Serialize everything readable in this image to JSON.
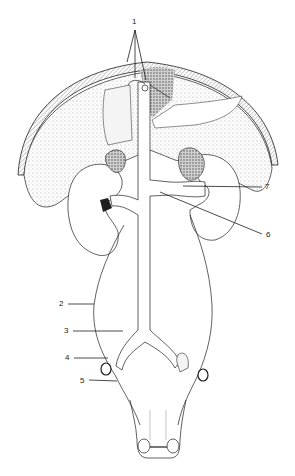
{
  "diagram": {
    "type": "anatomical-illustration",
    "colors": {
      "ink": "#1e1e1e",
      "stipple": "#9a9a9a",
      "background": "#ffffff"
    },
    "labels": [
      {
        "id": "1",
        "text": "1",
        "x": 134,
        "y": 22
      },
      {
        "id": "2",
        "text": "2",
        "x": 59,
        "y": 304
      },
      {
        "id": "3",
        "text": "3",
        "x": 64,
        "y": 331
      },
      {
        "id": "4",
        "text": "4",
        "x": 65,
        "y": 359
      },
      {
        "id": "5",
        "text": "5",
        "x": 80,
        "y": 381
      },
      {
        "id": "6",
        "text": "6",
        "x": 267,
        "y": 236
      },
      {
        "id": "7",
        "text": "7",
        "x": 265,
        "y": 189
      }
    ]
  }
}
